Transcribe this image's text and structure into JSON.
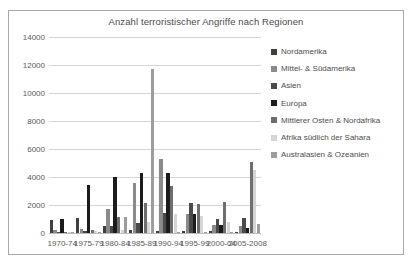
{
  "chart_data": {
    "type": "bar",
    "title": "Anzahl terroristischer Angriffe nach Regionen",
    "xlabel": "",
    "ylabel": "",
    "ylim": [
      0,
      14000
    ],
    "yticks": [
      0,
      2000,
      4000,
      6000,
      8000,
      10000,
      12000,
      14000
    ],
    "ytick_labels": [
      "0",
      "2000",
      "4000",
      "6000",
      "8000",
      "10000",
      "12000",
      "14000"
    ],
    "grid": true,
    "legend_position": "right",
    "categories": [
      "1970-74",
      "1975-79",
      "1980-84",
      "1985-89",
      "1990-94",
      "1995-99",
      "2000-04",
      "2005-2008"
    ],
    "series": [
      {
        "name": "Nordamerika",
        "color": "#3f3f3f",
        "values": [
          900,
          1050,
          500,
          250,
          150,
          130,
          120,
          60
        ]
      },
      {
        "name": "Mittel- & Südamerika",
        "color": "#8a8a8a",
        "values": [
          210,
          260,
          1750,
          3600,
          5300,
          1350,
          600,
          500
        ]
      },
      {
        "name": "Asien",
        "color": "#4a4a4a",
        "values": [
          60,
          120,
          480,
          700,
          1400,
          2150,
          1000,
          1100
        ]
      },
      {
        "name": "Europa",
        "color": "#1c1c1c",
        "values": [
          1020,
          3450,
          4000,
          4300,
          4300,
          1350,
          560,
          350
        ]
      },
      {
        "name": "Mittlerer Osten & Nordafrika",
        "color": "#6e6e6e",
        "values": [
          70,
          230,
          1150,
          2150,
          3350,
          2100,
          2250,
          5050
        ]
      },
      {
        "name": "Afrika südlich der Sahara",
        "color": "#d5d5d5",
        "values": [
          40,
          110,
          250,
          800,
          1350,
          1200,
          800,
          4500
        ]
      },
      {
        "name": "Australasien & Ozeanien",
        "color": "#9d9d9d",
        "values": [
          20,
          80,
          1150,
          11700,
          80,
          60,
          40,
          650
        ]
      }
    ]
  }
}
